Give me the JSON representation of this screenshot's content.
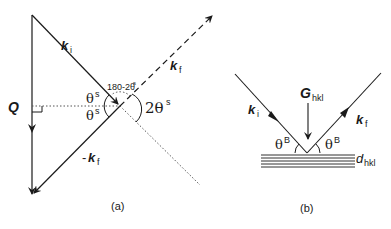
{
  "figure": {
    "panel_a": {
      "caption": "(a)",
      "labels": {
        "ki": "k",
        "ki_sub": "i",
        "kf": "k",
        "kf_sub": "f",
        "neg_kf_prefix": "-",
        "neg_kf": "k",
        "neg_kf_sub": "f",
        "Q": "Q",
        "theta_top": "θ",
        "theta_top_sup": "s",
        "theta_bottom": "θ",
        "theta_bottom_sup": "s",
        "angle_supplement": "180-2θ",
        "angle_supplement_sup": "s",
        "two_theta": "2θ",
        "two_theta_sup": "s"
      }
    },
    "panel_b": {
      "caption": "(b)",
      "labels": {
        "ki": "k",
        "ki_sub": "i",
        "kf": "k",
        "kf_sub": "f",
        "G": "G",
        "G_sub": "hkl",
        "theta_left": "θ",
        "theta_left_sup": "B",
        "theta_right": "θ",
        "theta_right_sup": "B",
        "d": "d",
        "d_sub": "hkl"
      }
    },
    "colors": {
      "line": "#1a1a1a",
      "dotted": "#555555"
    }
  }
}
